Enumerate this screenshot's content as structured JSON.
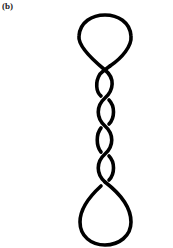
{
  "figure": {
    "panel_label": "(b)",
    "stroke_color": "#000000",
    "crossings": 5
  }
}
